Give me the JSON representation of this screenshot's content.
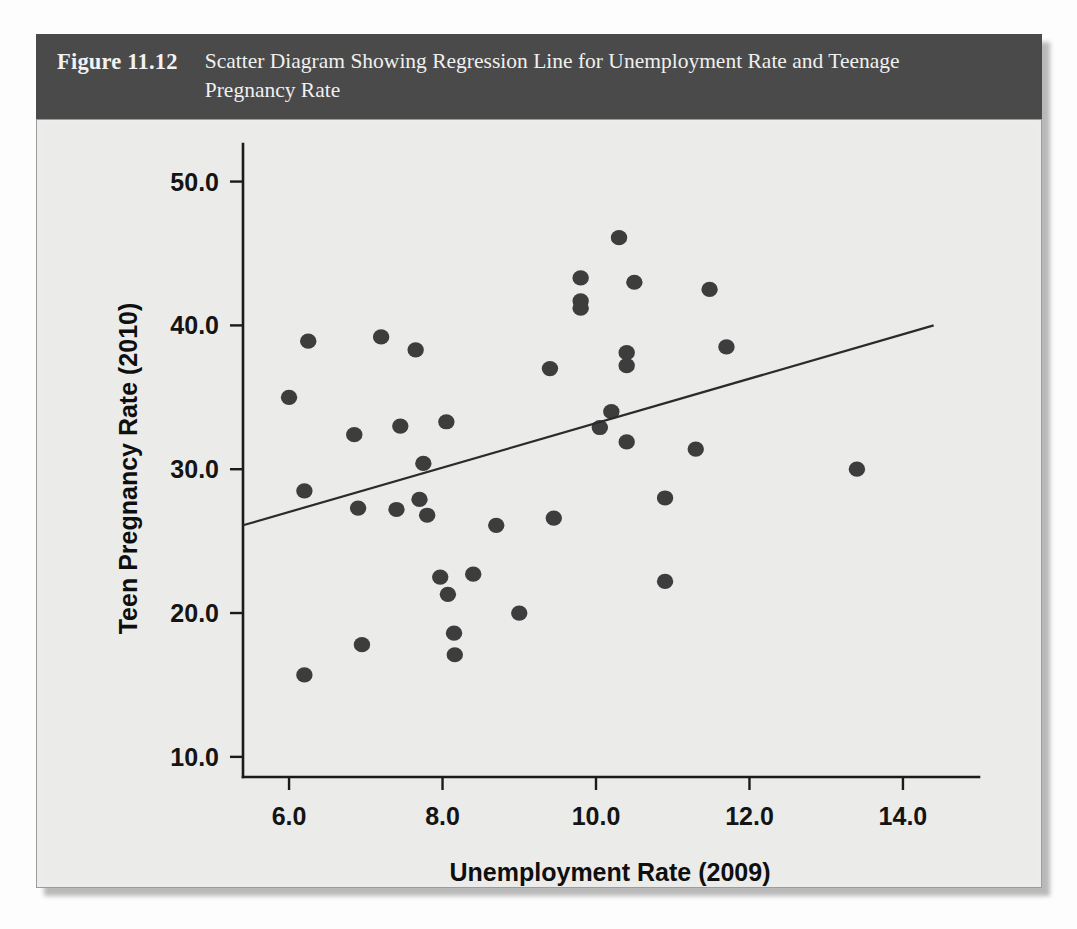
{
  "figure": {
    "number": "Figure 11.12",
    "caption": "Scatter Diagram Showing Regression Line for Unemployment Rate and Teenage Pregnancy Rate"
  },
  "colors": {
    "banner_background": "#4a4a4a",
    "banner_text": "#f0f0f0",
    "panel_background": "#ebebe9",
    "axis": "#1b1b1b",
    "point": "#3d3d3d",
    "regression_line": "#2b2b2b"
  },
  "chart_data": {
    "type": "scatter",
    "title": "Scatter Diagram Showing Regression Line for Unemployment Rate and Teenage Pregnancy Rate",
    "xlabel": "Unemployment Rate (2009)",
    "ylabel": "Teen Pregnancy Rate (2010)",
    "xlim": [
      5.4,
      14.6
    ],
    "ylim": [
      8.6,
      51.5
    ],
    "xticks": [
      6.0,
      8.0,
      10.0,
      12.0,
      14.0
    ],
    "xtick_labels": [
      "6.0",
      "8.0",
      "10.0",
      "12.0",
      "14.0"
    ],
    "yticks": [
      10.0,
      20.0,
      30.0,
      40.0,
      50.0
    ],
    "ytick_labels": [
      "10.0",
      "20.0",
      "30.0",
      "40.0",
      "50.0"
    ],
    "grid": false,
    "legend": false,
    "points": [
      {
        "x": 6.0,
        "y": 35.0
      },
      {
        "x": 6.25,
        "y": 38.9
      },
      {
        "x": 6.2,
        "y": 28.5
      },
      {
        "x": 6.2,
        "y": 15.7
      },
      {
        "x": 6.85,
        "y": 32.4
      },
      {
        "x": 6.9,
        "y": 27.3
      },
      {
        "x": 6.95,
        "y": 17.8
      },
      {
        "x": 7.2,
        "y": 39.2
      },
      {
        "x": 7.45,
        "y": 33.0
      },
      {
        "x": 7.4,
        "y": 27.2
      },
      {
        "x": 7.65,
        "y": 38.3
      },
      {
        "x": 7.7,
        "y": 27.9
      },
      {
        "x": 7.75,
        "y": 30.4
      },
      {
        "x": 7.8,
        "y": 26.8
      },
      {
        "x": 8.05,
        "y": 33.3
      },
      {
        "x": 7.97,
        "y": 22.5
      },
      {
        "x": 8.07,
        "y": 21.3
      },
      {
        "x": 8.15,
        "y": 18.6
      },
      {
        "x": 8.16,
        "y": 17.1
      },
      {
        "x": 8.4,
        "y": 22.7
      },
      {
        "x": 8.7,
        "y": 26.1
      },
      {
        "x": 9.0,
        "y": 20.0
      },
      {
        "x": 9.4,
        "y": 37.0
      },
      {
        "x": 9.45,
        "y": 26.6
      },
      {
        "x": 9.8,
        "y": 43.3
      },
      {
        "x": 9.8,
        "y": 41.7
      },
      {
        "x": 9.8,
        "y": 41.2
      },
      {
        "x": 10.3,
        "y": 46.1
      },
      {
        "x": 10.5,
        "y": 43.0
      },
      {
        "x": 10.4,
        "y": 38.1
      },
      {
        "x": 10.4,
        "y": 37.2
      },
      {
        "x": 10.2,
        "y": 34.0
      },
      {
        "x": 10.05,
        "y": 32.9
      },
      {
        "x": 10.4,
        "y": 31.9
      },
      {
        "x": 10.9,
        "y": 28.0
      },
      {
        "x": 10.9,
        "y": 22.2
      },
      {
        "x": 11.3,
        "y": 31.4
      },
      {
        "x": 11.48,
        "y": 42.5
      },
      {
        "x": 11.7,
        "y": 38.5
      },
      {
        "x": 13.4,
        "y": 30.0
      }
    ],
    "regression_line": {
      "x_start": 5.4,
      "y_start": 26.1,
      "x_end": 14.4,
      "y_end": 40.0
    }
  }
}
